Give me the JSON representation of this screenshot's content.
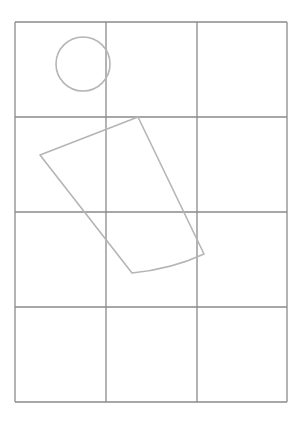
{
  "diagram": {
    "grid": {
      "columns": 3,
      "rows": 4,
      "left": 15,
      "top": 22,
      "right": 287,
      "bottom": 402,
      "vertical_lines_x": [
        15,
        106,
        197,
        287
      ],
      "horizontal_lines_y": [
        22,
        117,
        212,
        307,
        402
      ],
      "line_color": "#8a8a8a"
    },
    "shapes": [
      {
        "type": "circle",
        "label": "circle",
        "cx": 83,
        "cy": 64,
        "r": 27,
        "stroke": "#b5b5b5"
      },
      {
        "type": "quadrilateral",
        "label": "tilted-quadrilateral",
        "points": [
          [
            138,
            117
          ],
          [
            40,
            155
          ],
          [
            132,
            273
          ],
          [
            204,
            254
          ]
        ],
        "stroke": "#b5b5b5"
      }
    ]
  }
}
